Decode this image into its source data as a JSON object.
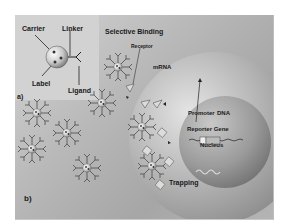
{
  "inset_a": {
    "panel_label": "a)",
    "labels": {
      "carrier": "Carrier",
      "linker": "Linker",
      "label": "Label",
      "ligand": "Ligand"
    }
  },
  "main_b": {
    "panel_label": "b)",
    "labels": {
      "selective_binding": "Selective Binding",
      "receptor": "Receptor",
      "mrna": "mRNA",
      "promoter": "Promoter",
      "dna": "DNA",
      "reporter_gene": "Reporter Gene",
      "nucleus": "Nucleus",
      "trapping": "Trapping"
    }
  },
  "colors": {
    "background": "#b8b8b8",
    "inset": "#d2d2d2",
    "cell": "#a8a8a8",
    "nucleus": "#8e8e8e",
    "text": "#1a1a1a"
  }
}
